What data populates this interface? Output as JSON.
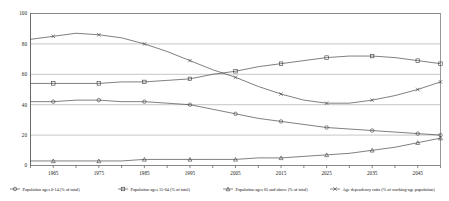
{
  "chart_data": {
    "type": "line",
    "title": "",
    "xlabel": "",
    "ylabel": "",
    "xlim": [
      1960,
      2050
    ],
    "ylim": [
      0,
      100
    ],
    "yticks": [
      0,
      20,
      40,
      60,
      80,
      100
    ],
    "xticks": [
      1965,
      1975,
      1985,
      1995,
      2005,
      2015,
      2025,
      2035,
      2045
    ],
    "grid": true,
    "legend_position": "bottom",
    "x": [
      1960,
      1965,
      1970,
      1975,
      1980,
      1985,
      1990,
      1995,
      2000,
      2005,
      2010,
      2015,
      2020,
      2025,
      2030,
      2035,
      2040,
      2045,
      2050
    ],
    "series": [
      {
        "name": "Population ages 0-14 (% of total)",
        "marker": "circle",
        "values": [
          42,
          42,
          43,
          43,
          42,
          42,
          41,
          40,
          37,
          34,
          31,
          29,
          27,
          25,
          24,
          23,
          22,
          21,
          20
        ]
      },
      {
        "name": "Population ages 15-64 (% of total)",
        "marker": "square",
        "values": [
          54,
          54,
          54,
          54,
          55,
          55,
          56,
          57,
          60,
          62,
          65,
          67,
          69,
          71,
          72,
          72,
          71,
          69,
          67
        ]
      },
      {
        "name": "Population ages 65 and above (% of total)",
        "marker": "triangle",
        "values": [
          3,
          3,
          3,
          3,
          3,
          4,
          4,
          4,
          4,
          4,
          5,
          5,
          6,
          7,
          8,
          10,
          12,
          15,
          18
        ]
      },
      {
        "name": "Age dependency ratio (% of working-age population)",
        "marker": "cross",
        "values": [
          83,
          85,
          87,
          86,
          84,
          80,
          75,
          69,
          63,
          58,
          52,
          47,
          43,
          41,
          41,
          43,
          46,
          50,
          55
        ]
      }
    ]
  },
  "legend": {
    "items": [
      {
        "label": "Population ages 0-14 (% of total)",
        "marker": "circle"
      },
      {
        "label": "Population ages 15-64 (% of total)",
        "marker": "square"
      },
      {
        "label": "Population ages 65 and above (% of total)",
        "marker": "triangle"
      },
      {
        "label": "Age dependency ratio (% of working-age population)",
        "marker": "cross"
      }
    ]
  },
  "colors": {
    "line": "#3a3a3a",
    "grid": "#8a8a8a",
    "frame": "#6e6e6e",
    "text": "#1a1a1a",
    "background": "#ffffff"
  }
}
